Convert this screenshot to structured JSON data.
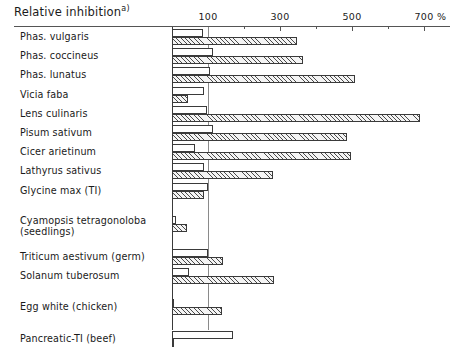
{
  "header": {
    "axis_title": "Relative inhibition",
    "axis_title_footnote": "a)",
    "unit_label": "%"
  },
  "chart_data": {
    "type": "bar",
    "orientation": "horizontal",
    "xlabel": "%",
    "ylabel": "",
    "xlim": [
      0,
      760
    ],
    "grid": false,
    "reference_line": 100,
    "tick_labels": [
      "100",
      "300",
      "500",
      "700"
    ],
    "tick_values": [
      100,
      300,
      500,
      700
    ],
    "minor_tick_values": [
      200,
      400,
      600
    ],
    "legend_position": "none",
    "series": [
      {
        "name": "upper-open-bar",
        "style": "open"
      },
      {
        "name": "lower-hatched-bar",
        "style": "hatched"
      }
    ],
    "categories": [
      "Phas. vulgaris",
      "Phas. coccineus",
      "Phas. lunatus",
      "Vicia faba",
      "Lens culinaris",
      "Pisum sativum",
      "Cicer arietinum",
      "Lathyrus sativus",
      "Glycine max (TI)",
      "Cyamopsis tetragonoloba (seedlings)",
      "Triticum aestivum (germ)",
      "Solanum tuberosum",
      "Egg white (chicken)",
      "Pancreatic-TI (beef)"
    ],
    "rows": [
      {
        "label": "Phas. vulgaris",
        "label2": "",
        "open": 87,
        "hatched": 348,
        "gap": 0
      },
      {
        "label": "Phas. coccineus",
        "label2": "",
        "open": 115,
        "hatched": 365,
        "gap": 0
      },
      {
        "label": "Phas. lunatus",
        "label2": "",
        "open": 105,
        "hatched": 508,
        "gap": 0
      },
      {
        "label": "Vicia faba",
        "label2": "",
        "open": 89,
        "hatched": 45,
        "gap": 0
      },
      {
        "label": "Lens culinaris",
        "label2": "",
        "open": 96,
        "hatched": 690,
        "gap": 0
      },
      {
        "label": "Pisum sativum",
        "label2": "",
        "open": 113,
        "hatched": 487,
        "gap": 0
      },
      {
        "label": "Cicer arietinum",
        "label2": "",
        "open": 65,
        "hatched": 498,
        "gap": 0
      },
      {
        "label": "Lathyrus sativus",
        "label2": "",
        "open": 88,
        "hatched": 280,
        "gap": 0
      },
      {
        "label": "Glycine max (TI)",
        "label2": "",
        "open": 100,
        "hatched": 90,
        "gap": 0
      },
      {
        "label": "Cyamopsis tetragonoloba",
        "label2": "(seedlings)",
        "open": 12,
        "hatched": 42,
        "gap": 14
      },
      {
        "label": "Triticum aestivum (germ)",
        "label2": "",
        "open": 100,
        "hatched": 142,
        "gap": 14
      },
      {
        "label": "Solanum tuberosum",
        "label2": "",
        "open": 48,
        "hatched": 283,
        "gap": 0
      },
      {
        "label": "Egg white (chicken)",
        "label2": "",
        "open": 2,
        "hatched": 140,
        "gap": 12
      },
      {
        "label": "Pancreatic-TI (beef)",
        "label2": "",
        "open": 170,
        "hatched": 2,
        "gap": 12
      }
    ]
  }
}
